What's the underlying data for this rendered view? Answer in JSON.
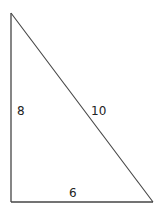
{
  "diagram": {
    "type": "right-triangle",
    "stroke_color": "#333333",
    "vertices": {
      "top": {
        "x": 11,
        "y": 13
      },
      "bottom_left": {
        "x": 11,
        "y": 202
      },
      "bottom_right": {
        "x": 153,
        "y": 202
      }
    },
    "labels": {
      "vertical_side": "8",
      "hypotenuse": "10",
      "base": "6"
    }
  }
}
